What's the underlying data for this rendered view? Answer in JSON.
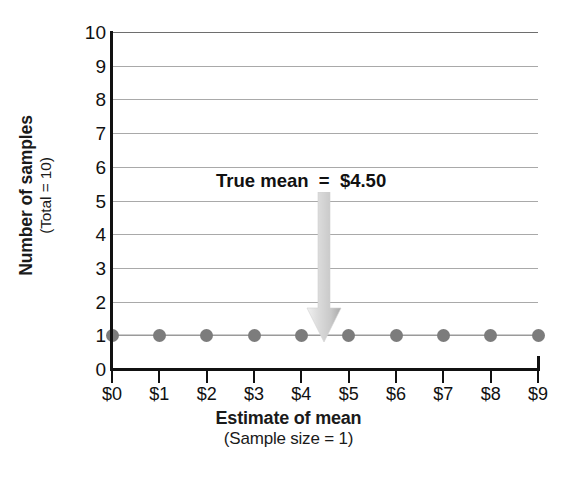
{
  "chart_data": {
    "type": "scatter",
    "title": "",
    "xlabel": "Estimate of mean",
    "xlabel_sub": "(Sample size = 1)",
    "ylabel": "Number of samples",
    "ylabel_sub": "(Total = 10)",
    "x": [
      0,
      1,
      2,
      3,
      4,
      5,
      6,
      7,
      8,
      9
    ],
    "values": [
      1,
      1,
      1,
      1,
      1,
      1,
      1,
      1,
      1,
      1
    ],
    "xtick_labels": [
      "$0",
      "$1",
      "$2",
      "$3",
      "$4",
      "$5",
      "$6",
      "$7",
      "$8",
      "$9"
    ],
    "ytick_labels": [
      "0",
      "1",
      "2",
      "3",
      "4",
      "5",
      "6",
      "7",
      "8",
      "9",
      "10"
    ],
    "ytick_values": [
      0,
      1,
      2,
      3,
      4,
      5,
      6,
      7,
      8,
      9,
      10
    ],
    "xlim": [
      0,
      9
    ],
    "ylim": [
      0,
      10
    ],
    "grid": true,
    "grid_axis": "y",
    "legend": false,
    "marker_color": "#7c7c7c",
    "line_color": "#9a9a9a",
    "grid_color": "#a9a9a9",
    "axis_color": "#111111",
    "annotations": [
      {
        "text": "True mean  =  $4.50",
        "x": 4.5,
        "y_text": 5.6,
        "arrow_from_y": 5.3,
        "arrow_to_y": 1.0,
        "arrow_color": "#c8c8c8"
      }
    ]
  }
}
